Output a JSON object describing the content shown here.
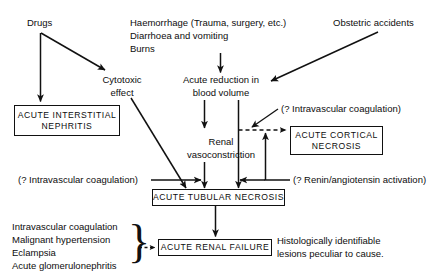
{
  "diagram": {
    "causes": {
      "drugs": "Drugs",
      "volume_loss_line1": "Haemorrhage (Trauma, surgery, etc.)",
      "volume_loss_line2": "Diarrhoea and vomiting",
      "volume_loss_line3": "Burns",
      "obstetric": "Obstetric accidents"
    },
    "mechanisms": {
      "cytotoxic_line1": "Cytotoxic",
      "cytotoxic_line2": "effect",
      "acute_reduction_line1": "Acute reduction in",
      "acute_reduction_line2": "blood volume",
      "renal_vaso_line1": "Renal",
      "renal_vaso_line2": "vasoconstriction"
    },
    "annotations": {
      "intravascular_coag_top": "(? Intravascular coagulation)",
      "intravascular_coag_left": "(? Intravascular coagulation)",
      "renin_angiotensin": "(? Renin/angiotensin activation)"
    },
    "outcomes": {
      "acute_interstitial_nephritis": "ACUTE INTERSTITIAL\nNEPHRITIS",
      "acute_cortical_necrosis": "ACUTE CORTICAL\nNECROSIS",
      "acute_tubular_necrosis": "ACUTE TUBULAR NECROSIS",
      "acute_renal_failure": "ACUTE RENAL FAILURE"
    },
    "other_causes": {
      "line1": "Intravascular coagulation",
      "line2": "Malignant hypertension",
      "line3": "Eclampsia",
      "line4": "Acute glomerulonephritis"
    },
    "note": {
      "line1": "Histologically identifiable",
      "line2": "lesions peculiar to cause."
    },
    "colors": {
      "ink": "#0d0d0d",
      "stroke": "#111111",
      "background": "#ffffff"
    }
  }
}
